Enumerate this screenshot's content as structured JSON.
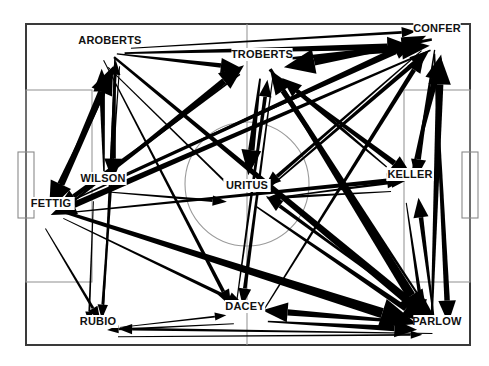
{
  "title": {
    "text": "UNC SPRING",
    "clipped": true
  },
  "diagram": {
    "kind": "soccer-pitch-passing-network",
    "background_color": "#ffffff",
    "line_color": "#000000",
    "arrow_color": "#000000",
    "pitch": {
      "outline": {
        "x": 26,
        "y": 24,
        "width": 444,
        "height": 321
      },
      "halfway_line_x": 247,
      "center_circle": {
        "cx": 247,
        "cy": 184,
        "r": 62
      },
      "center_spot": {
        "cx": 247,
        "cy": 184
      },
      "penalty_box_left": {
        "x": 26,
        "y": 90,
        "width": 66,
        "height": 192
      },
      "penalty_box_right": {
        "x": 404,
        "y": 90,
        "width": 66,
        "height": 192
      },
      "goal_box_left": {
        "x": 18,
        "y": 152,
        "width": 16,
        "height": 66
      },
      "goal_box_right": {
        "x": 462,
        "y": 152,
        "width": 16,
        "height": 66
      }
    },
    "players": [
      {
        "name": "AROBERTS",
        "x": 110,
        "y": 44,
        "anchor": "middle"
      },
      {
        "name": "TROBERTS",
        "x": 262,
        "y": 58,
        "anchor": "middle"
      },
      {
        "name": "CONFER",
        "x": 437,
        "y": 32,
        "anchor": "middle"
      },
      {
        "name": "WILSON",
        "x": 103,
        "y": 182,
        "anchor": "middle"
      },
      {
        "name": "FETTIG",
        "x": 51,
        "y": 207,
        "anchor": "middle"
      },
      {
        "name": "URITUS",
        "x": 247,
        "y": 189,
        "anchor": "middle"
      },
      {
        "name": "KELLER",
        "x": 410,
        "y": 178,
        "anchor": "middle"
      },
      {
        "name": "RUBIO",
        "x": 98,
        "y": 325,
        "anchor": "middle"
      },
      {
        "name": "DACEY",
        "x": 245,
        "y": 310,
        "anchor": "middle"
      },
      {
        "name": "PARLOW",
        "x": 437,
        "y": 325,
        "anchor": "middle"
      }
    ],
    "passes": [
      {
        "from": "AROBERTS",
        "to": "CONFER",
        "weight": 7
      },
      {
        "from": "AROBERTS",
        "to": "CONFER",
        "weight": 3
      },
      {
        "from": "AROBERTS",
        "to": "URITUS",
        "weight": 2
      },
      {
        "from": "AROBERTS",
        "to": "TROBERTS",
        "weight": 5
      },
      {
        "from": "AROBERTS",
        "to": "PARLOW",
        "weight": 9
      },
      {
        "from": "AROBERTS",
        "to": "DACEY",
        "weight": 4
      },
      {
        "from": "AROBERTS",
        "to": "WILSON",
        "weight": 6
      },
      {
        "from": "AROBERTS",
        "to": "FETTIG",
        "weight": 8
      },
      {
        "from": "AROBERTS",
        "to": "RUBIO",
        "weight": 3
      },
      {
        "from": "TROBERTS",
        "to": "CONFER",
        "weight": 8
      },
      {
        "from": "TROBERTS",
        "to": "KELLER",
        "weight": 6
      },
      {
        "from": "TROBERTS",
        "to": "PARLOW",
        "weight": 10
      },
      {
        "from": "TROBERTS",
        "to": "URITUS",
        "weight": 7
      },
      {
        "from": "TROBERTS",
        "to": "FETTIG",
        "weight": 5
      },
      {
        "from": "TROBERTS",
        "to": "DACEY",
        "weight": 4
      },
      {
        "from": "CONFER",
        "to": "TROBERTS",
        "weight": 9
      },
      {
        "from": "CONFER",
        "to": "KELLER",
        "weight": 5
      },
      {
        "from": "CONFER",
        "to": "PARLOW",
        "weight": 6
      },
      {
        "from": "CONFER",
        "to": "URITUS",
        "weight": 4
      },
      {
        "from": "CONFER",
        "to": "FETTIG",
        "weight": 7
      },
      {
        "from": "WILSON",
        "to": "AROBERTS",
        "weight": 6
      },
      {
        "from": "WILSON",
        "to": "URITUS",
        "weight": 3
      },
      {
        "from": "WILSON",
        "to": "CONFER",
        "weight": 5
      },
      {
        "from": "WILSON",
        "to": "RUBIO",
        "weight": 2
      },
      {
        "from": "FETTIG",
        "to": "AROBERTS",
        "weight": 8
      },
      {
        "from": "FETTIG",
        "to": "PARLOW",
        "weight": 11
      },
      {
        "from": "FETTIG",
        "to": "CONFER",
        "weight": 6
      },
      {
        "from": "FETTIG",
        "to": "KELLER",
        "weight": 5
      },
      {
        "from": "FETTIG",
        "to": "DACEY",
        "weight": 4
      },
      {
        "from": "FETTIG",
        "to": "RUBIO",
        "weight": 3
      },
      {
        "from": "FETTIG",
        "to": "TROBERTS",
        "weight": 7
      },
      {
        "from": "URITUS",
        "to": "CONFER",
        "weight": 5
      },
      {
        "from": "URITUS",
        "to": "PARLOW",
        "weight": 6
      },
      {
        "from": "URITUS",
        "to": "KELLER",
        "weight": 3
      },
      {
        "from": "KELLER",
        "to": "CONFER",
        "weight": 7
      },
      {
        "from": "KELLER",
        "to": "PARLOW",
        "weight": 4
      },
      {
        "from": "KELLER",
        "to": "URITUS",
        "weight": 3
      },
      {
        "from": "KELLER",
        "to": "TROBERTS",
        "weight": 5
      },
      {
        "from": "RUBIO",
        "to": "DACEY",
        "weight": 2
      },
      {
        "from": "RUBIO",
        "to": "PARLOW",
        "weight": 2
      },
      {
        "from": "RUBIO",
        "to": "AROBERTS",
        "weight": 3
      },
      {
        "from": "DACEY",
        "to": "RUBIO",
        "weight": 2
      },
      {
        "from": "DACEY",
        "to": "PARLOW",
        "weight": 6
      },
      {
        "from": "DACEY",
        "to": "TROBERTS",
        "weight": 4
      },
      {
        "from": "DACEY",
        "to": "CONFER",
        "weight": 5
      },
      {
        "from": "PARLOW",
        "to": "DACEY",
        "weight": 7
      },
      {
        "from": "PARLOW",
        "to": "CONFER",
        "weight": 8
      },
      {
        "from": "PARLOW",
        "to": "KELLER",
        "weight": 5
      },
      {
        "from": "PARLOW",
        "to": "TROBERTS",
        "weight": 6
      },
      {
        "from": "PARLOW",
        "to": "URITUS",
        "weight": 4
      },
      {
        "from": "PARLOW",
        "to": "RUBIO",
        "weight": 3
      }
    ]
  }
}
